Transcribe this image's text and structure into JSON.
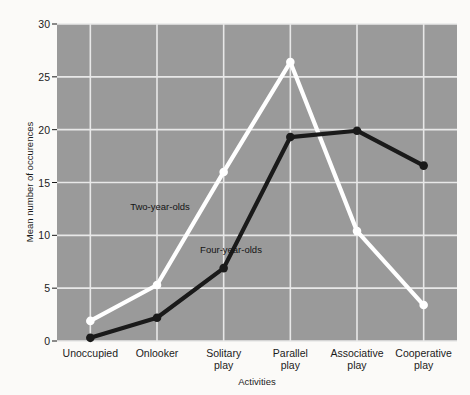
{
  "chart_data": {
    "type": "line",
    "title": "",
    "xlabel": "Activities",
    "ylabel": "Mean number of occurences",
    "categories": [
      "Unoccupied",
      "Onlooker",
      "Solitary play",
      "Parallel play",
      "Associative play",
      "Cooperative play"
    ],
    "category_lines": [
      [
        "Unoccupied"
      ],
      [
        "Onlooker"
      ],
      [
        "Solitary",
        "play"
      ],
      [
        "Parallel",
        "play"
      ],
      [
        "Associative",
        "play"
      ],
      [
        "Cooperative",
        "play"
      ]
    ],
    "yticks": [
      0,
      5,
      10,
      15,
      20,
      25,
      30
    ],
    "ylim": [
      0,
      30
    ],
    "grid": true,
    "legend": "annotations-on-plot",
    "series": [
      {
        "name": "Two-year-olds",
        "color": "#ffffff",
        "marker": "circle",
        "values": [
          1.9,
          5.3,
          16.0,
          26.4,
          10.4,
          3.4
        ],
        "annotation": "Two-year-olds"
      },
      {
        "name": "Four-year-olds",
        "color": "#1a1a1a",
        "marker": "circle",
        "values": [
          0.3,
          2.2,
          6.9,
          19.3,
          19.9,
          16.6
        ],
        "annotation": "Four-year-olds"
      }
    ],
    "annotations": [
      {
        "text": "Two-year-olds",
        "x": 160,
        "y": 210
      },
      {
        "text": "Four-year-olds",
        "x": 231,
        "y": 253
      }
    ],
    "colors": {
      "plot_background": "#9a9a9a",
      "page_background": "#fbfaf8",
      "gridline": "#e8e8e8",
      "two_year_olds": "#ffffff",
      "four_year_olds": "#1a1a1a",
      "text": "#1b1b1b"
    }
  }
}
